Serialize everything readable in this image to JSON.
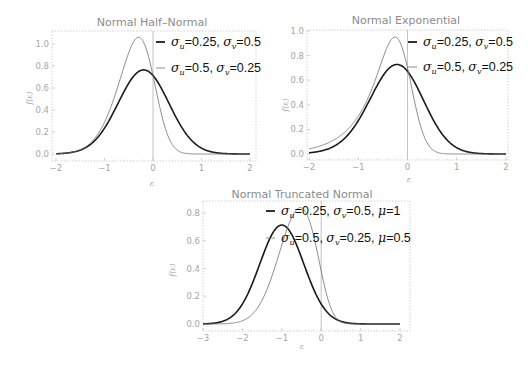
{
  "chart_data": [
    {
      "type": "line",
      "title": "Normal Half–Normal",
      "xlabel": "ε",
      "ylabel": "f(ε)",
      "xlim": [
        -2,
        2
      ],
      "ylim": [
        0,
        1.1
      ],
      "x_ticks": [
        "-2",
        "-1",
        "0",
        "1",
        "2"
      ],
      "y_ticks": [
        "0.0",
        "0.2",
        "0.4",
        "0.6",
        "0.8",
        "1.0"
      ],
      "model": "half-normal",
      "series": [
        {
          "name": "σu=0.25, σv=0.5",
          "sigma_u": 0.25,
          "sigma_v": 0.5,
          "style": "thick",
          "peak": [
            -0.2,
            0.76
          ]
        },
        {
          "name": "σu=0.5, σv=0.25",
          "sigma_u": 0.5,
          "sigma_v": 0.25,
          "style": "thin",
          "peak": [
            -0.3,
            1.06
          ]
        }
      ],
      "grid": false,
      "legend_position": "upper right (inside)"
    },
    {
      "type": "line",
      "title": "Normal Exponential",
      "xlabel": "ε",
      "ylabel": "f(ε)",
      "xlim": [
        -2,
        2
      ],
      "ylim": [
        0,
        1.0
      ],
      "x_ticks": [
        "-2",
        "-1",
        "0",
        "1",
        "2"
      ],
      "y_ticks": [
        "0.0",
        "0.2",
        "0.4",
        "0.6",
        "0.8",
        "1.0"
      ],
      "model": "exponential",
      "series": [
        {
          "name": "σu=0.25, σv=0.5",
          "sigma_u": 0.25,
          "sigma_v": 0.5,
          "style": "thick",
          "peak": [
            -0.2,
            0.73
          ]
        },
        {
          "name": "σu=0.5, σv=0.25",
          "sigma_u": 0.5,
          "sigma_v": 0.25,
          "style": "thin",
          "peak": [
            -0.25,
            0.95
          ]
        }
      ],
      "grid": false,
      "legend_position": "upper right (inside)"
    },
    {
      "type": "line",
      "title": "Normal Truncated Normal",
      "xlabel": "ε",
      "ylabel": "f(ε)",
      "xlim": [
        -3,
        2
      ],
      "ylim": [
        0,
        0.85
      ],
      "x_ticks": [
        "-3",
        "-2",
        "-1",
        "0",
        "1",
        "2"
      ],
      "y_ticks": [
        "0.0",
        "0.2",
        "0.4",
        "0.6",
        "0.8"
      ],
      "model": "truncated-normal",
      "series": [
        {
          "name": "σu=0.25, σv=0.5, μ=1",
          "sigma_u": 0.25,
          "sigma_v": 0.5,
          "mu": 1,
          "style": "thick",
          "peak": [
            -1.0,
            0.71
          ]
        },
        {
          "name": "σu=0.5, σv=0.25, μ=0.5",
          "sigma_u": 0.5,
          "sigma_v": 0.25,
          "mu": 0.5,
          "style": "thin",
          "peak": [
            -0.5,
            0.83
          ]
        }
      ],
      "grid": false,
      "legend_position": "upper right (inside, overlapping curves)"
    }
  ],
  "panels": [
    {
      "title": "Normal Half–Normal",
      "ylabel": "f(ε)",
      "xlabel": "ε",
      "legend": [
        {
          "sig_u": "0.25",
          "sig_v": "0.5",
          "mu": null
        },
        {
          "sig_u": "0.5",
          "sig_v": "0.25",
          "mu": null
        }
      ]
    },
    {
      "title": "Normal Exponential",
      "ylabel": "f(ε)",
      "xlabel": "ε",
      "legend": [
        {
          "sig_u": "0.25",
          "sig_v": "0.5",
          "mu": null
        },
        {
          "sig_u": "0.5",
          "sig_v": "0.25",
          "mu": null
        }
      ]
    },
    {
      "title": "Normal Truncated Normal",
      "ylabel": "f(ε)",
      "xlabel": "ε",
      "legend": [
        {
          "sig_u": "0.25",
          "sig_v": "0.5",
          "mu": "1"
        },
        {
          "sig_u": "0.5",
          "sig_v": "0.25",
          "mu": "0.5"
        }
      ]
    }
  ],
  "colors": {
    "thick": "#1a1a1a",
    "thin": "#6e6e6e",
    "frame": "#c8c8c8",
    "tick_label": "#a6a6a6",
    "title": "#8c8c8c",
    "zero_line": "#b4b4b4"
  }
}
